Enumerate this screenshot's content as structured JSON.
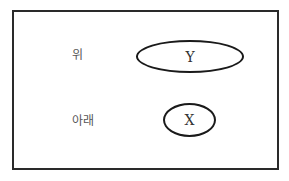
{
  "diagram": {
    "labels": {
      "upper": "위",
      "lower": "아래"
    },
    "nodes": [
      {
        "id": "Y",
        "label": "Y",
        "position": "upper",
        "shape": "ellipse"
      },
      {
        "id": "X",
        "label": "X",
        "position": "lower",
        "shape": "ellipse"
      }
    ],
    "colors": {
      "border": "#1a1a1a",
      "label_text": "#555555",
      "node_text": "#333333"
    }
  }
}
